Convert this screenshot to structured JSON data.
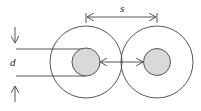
{
  "diagram": {
    "labels": {
      "diameter": "d",
      "spacing": "s"
    },
    "colors": {
      "stroke": "#444444",
      "core_fill": "#d9d9d9",
      "background": "#ffffff"
    },
    "conductors": [
      {
        "name": "left",
        "cx": 86,
        "cy": 62,
        "outer_r": 36,
        "inner_r": 14
      },
      {
        "name": "right",
        "cx": 157,
        "cy": 62,
        "outer_r": 36,
        "inner_r": 14
      }
    ]
  }
}
